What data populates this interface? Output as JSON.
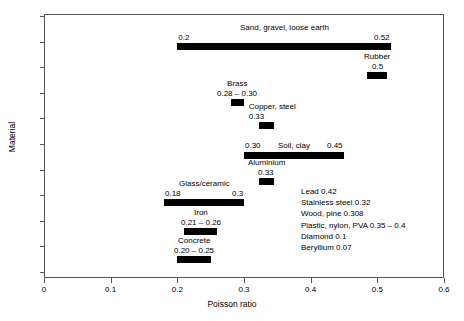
{
  "chart_data": {
    "type": "bar",
    "orientation": "horizontal",
    "title": "",
    "xlabel": "Poisson ratio",
    "ylabel": "Material",
    "xlim": [
      0,
      0.6
    ],
    "xticks": [
      "0",
      "0.1",
      "0.2",
      "0.3",
      "0.4",
      "0.5",
      "0.6"
    ],
    "xtick_values": [
      0,
      0.1,
      0.2,
      0.3,
      0.4,
      0.5,
      0.6
    ],
    "grid": false,
    "legend": "none",
    "y_axis_ticks_labeled": false,
    "y_tick_count": 11,
    "categories": [
      "Sand, gravel, loose earth",
      "Rubber",
      "Brass",
      "Copper, steel",
      "Soil, clay",
      "Aluminium",
      "Glass/ceramic",
      "Iron",
      "Concrete"
    ],
    "bars": [
      {
        "name": "Sand, gravel, loose earth",
        "label": "Sand, gravel, loose earth",
        "low": 0.2,
        "high": 0.52,
        "low_text": "0.2",
        "high_text": "0.52",
        "range_text": ""
      },
      {
        "name": "Rubber",
        "label": "Rubber",
        "low": 0.485,
        "high": 0.515,
        "low_text": "",
        "high_text": "",
        "range_text": "0.5"
      },
      {
        "name": "Brass",
        "label": "Brass",
        "low": 0.28,
        "high": 0.3,
        "low_text": "",
        "high_text": "",
        "range_text": "0.28 – 0.30"
      },
      {
        "name": "Copper, steel",
        "label": "Copper, steel",
        "low": 0.322,
        "high": 0.345,
        "low_text": "",
        "high_text": "",
        "range_text": "0.33"
      },
      {
        "name": "Soil, clay",
        "label": "Soil, clay",
        "low": 0.3,
        "high": 0.45,
        "low_text": "0.30",
        "high_text": "0.45",
        "range_text": ""
      },
      {
        "name": "Aluminium",
        "label": "Aluminium",
        "low": 0.322,
        "high": 0.345,
        "low_text": "",
        "high_text": "",
        "range_text": "0.33"
      },
      {
        "name": "Glass/ceramic",
        "label": "Glass/ceramic",
        "low": 0.18,
        "high": 0.3,
        "low_text": "0.18",
        "high_text": "0.3",
        "range_text": ""
      },
      {
        "name": "Iron",
        "label": "Iron",
        "low": 0.21,
        "high": 0.26,
        "low_text": "",
        "high_text": "",
        "range_text": "0.21 – 0.26"
      },
      {
        "name": "Concrete",
        "label": "Concrete",
        "low": 0.2,
        "high": 0.25,
        "low_text": "",
        "high_text": "",
        "range_text": "0.20 – 0.25"
      }
    ],
    "extra_values": [
      {
        "name": "Lead",
        "value_text": "0.42",
        "text": "Lead 0.42"
      },
      {
        "name": "Stainless steel",
        "value_text": "0.32",
        "text": "Stainless steel 0.32"
      },
      {
        "name": "Wood, pine",
        "value_text": "0.308",
        "text": "Wood, pine  0.308"
      },
      {
        "name": "Plastic, nylon, PVA",
        "value_text": "0.35 – 0.4",
        "text": "Plastic, nylon, PVA 0.35 – 0.4"
      },
      {
        "name": "Diamond",
        "value_text": "0.1",
        "text": "Diamond 0.1"
      },
      {
        "name": "Beryllium",
        "value_text": "0.07",
        "text": "Beryllium 0.07"
      }
    ],
    "colors": {
      "bar": "#000000",
      "axis": "#555555",
      "text": "#000000",
      "background": "#ffffff"
    }
  }
}
